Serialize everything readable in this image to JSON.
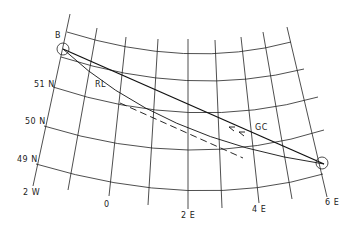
{
  "figure": {
    "title": "",
    "points": {
      "start": {
        "label": "B"
      },
      "end": {
        "label": ""
      }
    },
    "routes": [
      {
        "id": "great-circle",
        "label": "GC",
        "style": "solid",
        "direction_arrows": true
      },
      {
        "id": "rhumb-line",
        "label": "RL",
        "style": "solid-curved"
      },
      {
        "id": "rhumb-line-chart",
        "label": "",
        "style": "dashed"
      }
    ],
    "latitude_labels": [
      "51 N",
      "50 N",
      "49 N"
    ],
    "longitude_labels": [
      "2 W",
      "0",
      "2 E",
      "4 E",
      "6 E"
    ]
  },
  "colors": {
    "background": "#ffffff",
    "ink": "#222222"
  }
}
